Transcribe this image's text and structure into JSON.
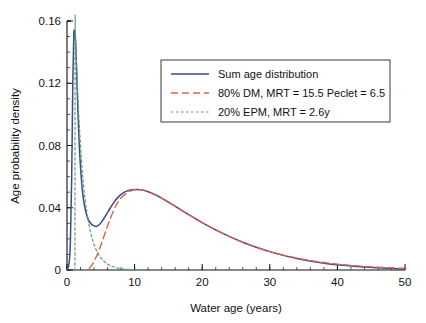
{
  "chart_data": {
    "type": "line",
    "title": "",
    "xlabel": "Water age (years)",
    "ylabel": "Age probability density",
    "xlim": [
      0,
      50
    ],
    "ylim": [
      0,
      0.16
    ],
    "grid": false,
    "legend_position": "upper-center-right",
    "xticks": [
      0,
      10,
      20,
      30,
      40,
      50
    ],
    "xticklabels": [
      "0",
      "10",
      "20",
      "30",
      "40",
      "50"
    ],
    "xminor_step": 2,
    "yticks": [
      0,
      0.04,
      0.08,
      0.12,
      0.16
    ],
    "yticklabels": [
      "0",
      "0.04",
      "0.08",
      "0.12",
      "0.16"
    ],
    "yminor_step": 0.01,
    "colors": {
      "sum": "#3b4a8c",
      "dm": "#e4604a",
      "epm": "#5f9e7a",
      "axis": "#111111",
      "legend_border": "#3a3a3a"
    },
    "series": [
      {
        "name": "Sum age distribution",
        "key": "sum",
        "color": "#3b4a8c",
        "style": "solid",
        "width": 1.5,
        "x": [
          0.05,
          0.3,
          0.5,
          0.7,
          0.85,
          1.0,
          1.1,
          1.2,
          1.3,
          1.45,
          1.6,
          1.8,
          2.0,
          2.3,
          2.6,
          3.0,
          3.4,
          3.8,
          4.3,
          4.8,
          5.3,
          5.8,
          6.3,
          7.0,
          7.6,
          8.2,
          9.0,
          9.6,
          10.3,
          11.0,
          12.0,
          13.0,
          14.0,
          15.0,
          16.5,
          18.0,
          20.0,
          22.0,
          24.0,
          26.0,
          28.0,
          30.0,
          32.0,
          34.0,
          36.0,
          38.0,
          40.0,
          42.0,
          44.0,
          46.0,
          48.0,
          50.0
        ],
        "y": [
          0.0005,
          0.004,
          0.018,
          0.062,
          0.118,
          0.15,
          0.154,
          0.152,
          0.144,
          0.124,
          0.104,
          0.082,
          0.066,
          0.05,
          0.041,
          0.034,
          0.0305,
          0.0288,
          0.028,
          0.0292,
          0.032,
          0.0355,
          0.0392,
          0.0438,
          0.047,
          0.0493,
          0.051,
          0.0516,
          0.0518,
          0.0515,
          0.0503,
          0.0485,
          0.0462,
          0.0436,
          0.0396,
          0.0356,
          0.0305,
          0.0258,
          0.0216,
          0.0178,
          0.0146,
          0.0118,
          0.0094,
          0.0074,
          0.0057,
          0.0044,
          0.0033,
          0.0025,
          0.0019,
          0.0014,
          0.001,
          0.0007
        ]
      },
      {
        "name": "80% DM, MRT = 15.5 Peclet = 6.5",
        "key": "dm",
        "color": "#e4604a",
        "style": "dashed",
        "width": 1.4,
        "x": [
          3.3,
          3.8,
          4.3,
          4.8,
          5.3,
          5.8,
          6.3,
          7.0,
          7.6,
          8.2,
          9.0,
          9.6,
          10.3,
          11.0,
          12.0,
          13.0,
          14.0,
          15.0,
          16.5,
          18.0,
          20.0,
          22.0,
          24.0,
          26.0,
          28.0,
          30.0,
          32.0,
          34.0,
          36.0,
          38.0,
          40.0,
          42.0,
          44.0,
          46.0,
          48.0,
          50.0
        ],
        "y": [
          0.001,
          0.004,
          0.0082,
          0.0135,
          0.0196,
          0.0258,
          0.0318,
          0.0392,
          0.044,
          0.0473,
          0.05,
          0.0511,
          0.0517,
          0.0515,
          0.0503,
          0.0485,
          0.0462,
          0.0436,
          0.0396,
          0.0356,
          0.0305,
          0.0258,
          0.0216,
          0.0178,
          0.0146,
          0.0118,
          0.0096,
          0.0077,
          0.0061,
          0.0048,
          0.0038,
          0.003,
          0.0023,
          0.0018,
          0.0014,
          0.0011
        ]
      },
      {
        "name": "20% EPM, MRT = 2.6y",
        "key": "epm",
        "color": "#5f9e7a",
        "style": "dotted",
        "width": 1.2,
        "x": [
          1.18,
          1.2,
          1.25,
          1.35,
          1.5,
          1.7,
          1.9,
          2.2,
          2.5,
          2.9,
          3.3,
          3.7,
          4.1,
          4.6,
          5.1,
          5.6,
          6.1,
          6.6,
          7.1,
          7.6,
          8.2,
          8.8,
          9.5,
          10.2,
          11.0
        ],
        "y": [
          0.0,
          0.153,
          0.15,
          0.139,
          0.123,
          0.103,
          0.087,
          0.067,
          0.052,
          0.038,
          0.028,
          0.0205,
          0.0152,
          0.0105,
          0.0073,
          0.0051,
          0.0035,
          0.0025,
          0.0017,
          0.0012,
          0.0008,
          0.0005,
          0.0003,
          0.0002,
          0.0001
        ]
      }
    ]
  },
  "legend": {
    "entries": [
      {
        "label": "Sum age distribution"
      },
      {
        "label": "80% DM, MRT = 15.5 Peclet = 6.5"
      },
      {
        "label": "20% EPM, MRT = 2.6y"
      }
    ]
  }
}
